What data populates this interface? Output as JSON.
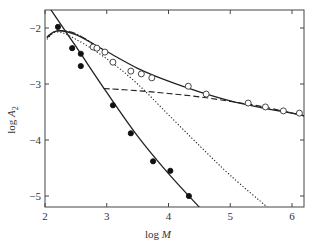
{
  "chart_data": {
    "type": "scatter",
    "title": "",
    "xlabel": "log M",
    "ylabel": "log A2",
    "xlim": [
      2,
      6.2
    ],
    "ylim": [
      -5.2,
      -1.65
    ],
    "xticks": [
      2,
      3,
      4,
      5,
      6
    ],
    "yticks": [
      -2,
      -3,
      -4,
      -5
    ],
    "xtick_labels": [
      "2",
      "3",
      "4",
      "5",
      "6"
    ],
    "ytick_labels": [
      "−2",
      "−3",
      "−4",
      "−5"
    ],
    "grid": false,
    "legend": null,
    "series": [
      {
        "name": "filled circles",
        "marker": "filled-circle",
        "x": [
          2.21,
          2.44,
          2.58,
          2.58,
          3.1,
          3.39,
          3.75,
          4.03,
          4.33
        ],
        "y": [
          -1.98,
          -2.36,
          -2.46,
          -2.68,
          -3.38,
          -3.88,
          -4.38,
          -4.55,
          -5.0
        ]
      },
      {
        "name": "open circles",
        "marker": "open-circle",
        "x": [
          2.78,
          2.84,
          2.97,
          3.1,
          3.39,
          3.56,
          3.73,
          4.32,
          4.61,
          5.29,
          5.57,
          5.86,
          6.12
        ],
        "y": [
          -2.34,
          -2.36,
          -2.43,
          -2.61,
          -2.77,
          -2.82,
          -2.89,
          -3.04,
          -3.18,
          -3.34,
          -3.41,
          -3.48,
          -3.52
        ]
      },
      {
        "name": "solid curve (filled fit)",
        "style": "solid",
        "x": [
          2.08,
          2.5,
          3.0,
          3.5,
          4.0,
          4.5
        ],
        "y": [
          -1.65,
          -2.33,
          -3.15,
          -3.93,
          -4.6,
          -5.2
        ]
      },
      {
        "name": "solid curve (open fit)",
        "style": "solid",
        "x": [
          2.03,
          2.2,
          2.5,
          3.0,
          3.5,
          4.0,
          4.5,
          5.0,
          5.5,
          6.0,
          6.2
        ],
        "y": [
          -2.16,
          -2.05,
          -2.12,
          -2.42,
          -2.72,
          -2.95,
          -3.14,
          -3.3,
          -3.42,
          -3.52,
          -3.57
        ]
      },
      {
        "name": "dotted curve",
        "style": "dotted",
        "x": [
          2.03,
          2.2,
          2.5,
          3.0,
          3.5,
          4.0,
          4.5,
          5.0,
          5.6
        ],
        "y": [
          -2.2,
          -2.07,
          -2.2,
          -2.55,
          -3.0,
          -3.55,
          -4.1,
          -4.63,
          -5.2
        ]
      },
      {
        "name": "dash-dot curve",
        "style": "dashdot",
        "x": [
          2.03,
          2.2,
          2.5,
          2.8
        ],
        "y": [
          -2.18,
          -2.05,
          -2.1,
          -2.3
        ]
      },
      {
        "name": "dashed curve",
        "style": "dashed",
        "x": [
          2.95,
          3.5,
          4.0,
          4.5,
          5.0,
          5.5,
          6.0,
          6.2
        ],
        "y": [
          -3.08,
          -3.12,
          -3.17,
          -3.23,
          -3.31,
          -3.4,
          -3.52,
          -3.57
        ]
      }
    ]
  },
  "axes": {
    "xlabel_main": "log ",
    "xlabel_var": "M",
    "ylabel_main": "log ",
    "ylabel_var": "A",
    "ylabel_sub": "2"
  }
}
